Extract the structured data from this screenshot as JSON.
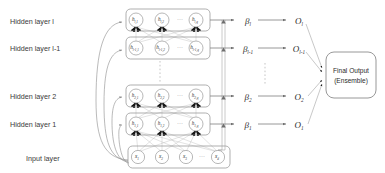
{
  "figure": {
    "background_color": "#ffffff",
    "line_color": "#9a9a9a",
    "text_color": "#2b2b2b"
  },
  "layer_labels": [
    {
      "id": "hidden-l",
      "text": "Hidden layer l",
      "x": 10,
      "y": 22
    },
    {
      "id": "hidden-l-1",
      "text": "Hidden layer l-1",
      "x": 10,
      "y": 48
    },
    {
      "id": "hidden-2",
      "text": "Hidden layer 2",
      "x": 10,
      "y": 97
    },
    {
      "id": "hidden-1",
      "text": "Hidden layer 1",
      "x": 10,
      "y": 125
    },
    {
      "id": "input",
      "text": "Input layer",
      "x": 26,
      "y": 162
    }
  ],
  "hidden_layers": [
    {
      "id": "hidden-layer-l",
      "row_y": 20,
      "nodes": [
        {
          "base": "h",
          "sub": "l,1"
        },
        {
          "base": "h",
          "sub": "l,2"
        },
        {
          "base": "h",
          "sub": "l,q"
        }
      ],
      "ellipsis": "···"
    },
    {
      "id": "hidden-layer-l-1",
      "row_y": 48,
      "nodes": [
        {
          "base": "h",
          "sub": "l-1,1"
        },
        {
          "base": "h",
          "sub": "l-1,2"
        },
        {
          "base": "h",
          "sub": "l-1,q"
        }
      ],
      "ellipsis": "···"
    },
    {
      "id": "hidden-layer-2",
      "row_y": 96,
      "nodes": [
        {
          "base": "h",
          "sub": "2,1"
        },
        {
          "base": "h",
          "sub": "2,2"
        },
        {
          "base": "h",
          "sub": "2,q"
        }
      ],
      "ellipsis": "···"
    },
    {
      "id": "hidden-layer-1",
      "row_y": 124,
      "nodes": [
        {
          "base": "h",
          "sub": "1,1"
        },
        {
          "base": "h",
          "sub": "1,2"
        },
        {
          "base": "h",
          "sub": "1,q"
        }
      ],
      "ellipsis": "···"
    }
  ],
  "input_layer": {
    "id": "input-layer",
    "row_y": 157,
    "nodes": [
      {
        "base": "x",
        "sub": "1"
      },
      {
        "base": "x",
        "sub": "2"
      },
      {
        "base": "x",
        "sub": "3"
      },
      {
        "base": "x",
        "sub": "d"
      }
    ],
    "ellipsis": "···"
  },
  "betas": [
    {
      "id": "beta-l",
      "base": "β",
      "sub": "l",
      "y": 22
    },
    {
      "id": "beta-l-1",
      "base": "β",
      "sub": "l-1",
      "y": 50
    },
    {
      "id": "beta-2",
      "base": "β",
      "sub": "2",
      "y": 98
    },
    {
      "id": "beta-1",
      "base": "β",
      "sub": "1",
      "y": 126
    }
  ],
  "outputs": [
    {
      "id": "output-l",
      "base": "O",
      "sub": "l",
      "y": 22
    },
    {
      "id": "output-l-1",
      "base": "O",
      "sub": "l-1",
      "y": 50
    },
    {
      "id": "output-2",
      "base": "O",
      "sub": "2",
      "y": 98
    },
    {
      "id": "output-1",
      "base": "O",
      "sub": "1",
      "y": 126
    }
  ],
  "final_output": {
    "id": "final-output-box",
    "line1": "Final Output",
    "line2": "(Ensemble)"
  },
  "vertical_ellipses": [
    {
      "id": "network-gap-dots",
      "x": 160,
      "y1": 60,
      "y2": 84
    },
    {
      "id": "output-gap-dots",
      "x": 265,
      "y1": 62,
      "y2": 86
    }
  ]
}
